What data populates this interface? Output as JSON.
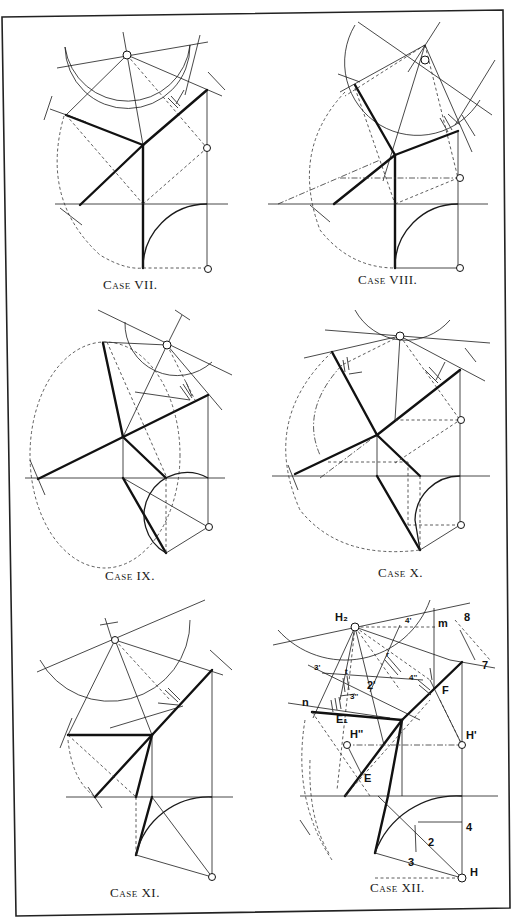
{
  "panels": [
    {
      "id": "case-7",
      "caption": "Case VII."
    },
    {
      "id": "case-8",
      "caption": "Case VIII."
    },
    {
      "id": "case-9",
      "caption": "Case IX."
    },
    {
      "id": "case-10",
      "caption": "Case X."
    },
    {
      "id": "case-11",
      "caption": "Case XI."
    },
    {
      "id": "case-12",
      "caption": "Case XII."
    }
  ],
  "case12_labels": {
    "H2": "H₂",
    "l4": "4'",
    "m": "m",
    "eight": "8",
    "seven": "7",
    "r": "r",
    "three_prime": "3'",
    "t": "t",
    "two_prime": "2'",
    "four_dbl": "4''",
    "three_dbl": "3''",
    "F": "F",
    "n": "n",
    "E1": "E₁",
    "Hdbl": "H''",
    "Hprime": "H'",
    "E": "E",
    "four": "4",
    "two": "2",
    "three": "3",
    "H": "H"
  },
  "colors": {
    "ink": "#111111",
    "paper": "#ffffff"
  }
}
